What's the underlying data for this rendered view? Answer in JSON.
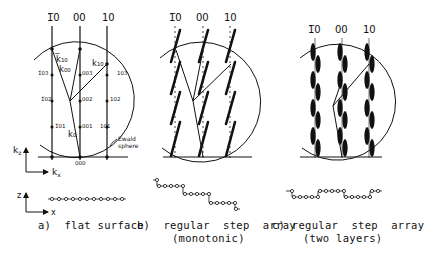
{
  "figure": {
    "panels": [
      {
        "id": "a",
        "caption": "a)  flat surface",
        "caption2": "",
        "rod_labels": [
          "̅0",
          "00",
          "10"
        ],
        "rod_labels_display": [
          "1̅0",
          "00",
          "10"
        ],
        "node_labels_left": [
          "1̅03",
          "1̅02",
          "1̅01"
        ],
        "node_labels_mid": [
          "003",
          "002",
          "001",
          "000"
        ],
        "node_labels_right": [
          "103",
          "102",
          "101"
        ],
        "wavevectors": [
          "k₁₀",
          "k₀₀",
          "k₁₀",
          "k₀"
        ],
        "wavevector_display": {
          "k_m10": "k̅₁₀",
          "k00": "k₀₀",
          "k10": "k₁₀",
          "k0": "k₀"
        },
        "sphere_label_1": "Ewald",
        "sphere_label_2": "sphere",
        "reciprocal_axes": {
          "vertical": "k",
          "vertical_sub": "z",
          "horizontal": "k",
          "horizontal_sub": "x"
        },
        "real_axes": {
          "vertical": "z",
          "horizontal": "x"
        }
      },
      {
        "id": "b",
        "caption": "b)  regular  step  array",
        "caption2": "(monotonic)",
        "rod_labels_display": [
          "1̅0",
          "00",
          "10"
        ]
      },
      {
        "id": "c",
        "caption": "c) regular  step  array",
        "caption2": "(two layers)",
        "rod_labels_display": [
          "1̅0",
          "00",
          "10"
        ]
      }
    ]
  },
  "colors": {
    "ink": "#111111",
    "paper": "#ffffff"
  }
}
